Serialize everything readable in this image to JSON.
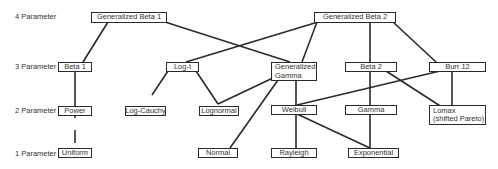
{
  "row_labels": {
    "four": "4 Parameter",
    "three": "3 Parameter",
    "two": "2 Parameter",
    "one": "1 Parameter"
  },
  "nodes": {
    "gb1": "Generalized Beta 1",
    "gb2": "Generalized Beta 2",
    "beta1": "Beta 1",
    "log_t": "Log-t",
    "gen_gamma_1": "Generalized",
    "gen_gamma_2": "Gamma",
    "beta2": "Beta 2",
    "burr12": "Burr 12",
    "power": "Power",
    "log_cauchy": "Log-Cauchy",
    "lognormal": "Lognormal",
    "weibull": "Weibull",
    "gamma": "Gamma",
    "lomax_1": "Lomax",
    "lomax_2": "(shifted Pareto)",
    "uniform": "Uniform",
    "normal": "Normal",
    "rayleigh": "Rayleigh",
    "exponential": "Exponential"
  },
  "edges": [
    [
      "Generalized Beta 1",
      "Beta 1"
    ],
    [
      "Generalized Beta 1",
      "Generalized Gamma"
    ],
    [
      "Generalized Beta 2",
      "Log-t"
    ],
    [
      "Generalized Beta 2",
      "Generalized Gamma"
    ],
    [
      "Generalized Beta 2",
      "Beta 2"
    ],
    [
      "Generalized Beta 2",
      "Burr 12"
    ],
    [
      "Beta 1",
      "Power"
    ],
    [
      "Power",
      "Uniform"
    ],
    [
      "Log-t",
      "Log-Cauchy"
    ],
    [
      "Log-t",
      "Lognormal"
    ],
    [
      "Generalized Gamma",
      "Lognormal"
    ],
    [
      "Generalized Gamma",
      "Weibull"
    ],
    [
      "Generalized Gamma",
      "Normal"
    ],
    [
      "Beta 2",
      "Gamma"
    ],
    [
      "Beta 2",
      "Lomax (shifted Pareto)"
    ],
    [
      "Burr 12",
      "Weibull"
    ],
    [
      "Burr 12",
      "Lomax (shifted Pareto)"
    ],
    [
      "Weibull",
      "Rayleigh"
    ],
    [
      "Weibull",
      "Exponential"
    ],
    [
      "Gamma",
      "Exponential"
    ]
  ]
}
